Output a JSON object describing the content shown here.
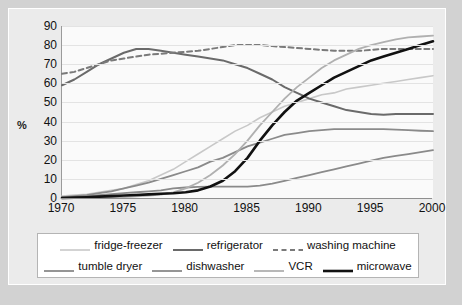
{
  "chart_data": {
    "type": "line",
    "title": "",
    "xlabel": "",
    "ylabel": "%",
    "xlim": [
      1970,
      2000
    ],
    "ylim": [
      0,
      90
    ],
    "grid": true,
    "legend_position": "bottom",
    "x_ticks": [
      "1970",
      "1975",
      "1980",
      "1985",
      "1990",
      "1995",
      "2000"
    ],
    "y_ticks": [
      "0",
      "10",
      "20",
      "30",
      "40",
      "50",
      "60",
      "70",
      "80",
      "90"
    ],
    "x": [
      1970,
      1971,
      1972,
      1973,
      1974,
      1975,
      1976,
      1977,
      1978,
      1979,
      1980,
      1981,
      1982,
      1983,
      1984,
      1985,
      1986,
      1987,
      1988,
      1989,
      1990,
      1991,
      1992,
      1993,
      1994,
      1995,
      1996,
      1997,
      1998,
      1999,
      2000
    ],
    "series": [
      {
        "name": "fridge-freezer",
        "color": "#c8c8c8",
        "width": 1.6,
        "dash": "none",
        "values": [
          1,
          1.5,
          2,
          3,
          4,
          5,
          7,
          9,
          12,
          15,
          19,
          23,
          27,
          31,
          35,
          38,
          42,
          45,
          48,
          50,
          52,
          54,
          55,
          57,
          58,
          59,
          60,
          61,
          62,
          63,
          64
        ]
      },
      {
        "name": "refrigerator",
        "color": "#6a6a6a",
        "width": 2.0,
        "dash": "none",
        "values": [
          59,
          62,
          66,
          70,
          73,
          76,
          78,
          78,
          77,
          76,
          75,
          74,
          73,
          72,
          70,
          68,
          65,
          62,
          58,
          55,
          52,
          50,
          48,
          46,
          45,
          44,
          43.5,
          44,
          44,
          44,
          44
        ]
      },
      {
        "name": "washing machine",
        "color": "#7a7a7a",
        "width": 2.0,
        "dash": "dashed",
        "values": [
          65,
          66,
          68,
          70,
          72,
          73,
          74,
          75,
          75.5,
          76,
          76.5,
          77,
          78,
          79,
          80,
          80,
          80,
          79.5,
          79,
          78.5,
          78,
          77.5,
          77,
          77,
          77,
          77.5,
          78,
          78,
          78,
          78,
          78
        ]
      },
      {
        "name": "tumble dryer",
        "color": "#8a8a8a",
        "width": 1.8,
        "dash": "none",
        "values": [
          0.5,
          1,
          1.5,
          2.5,
          3.5,
          5,
          6.5,
          8,
          10,
          12,
          14,
          16,
          19,
          21,
          24,
          27,
          29,
          31,
          33,
          34,
          35,
          35.5,
          36,
          36,
          36,
          36,
          36,
          35.8,
          35.5,
          35.2,
          35
        ]
      },
      {
        "name": "dishwasher",
        "color": "#8a8a8a",
        "width": 1.8,
        "dash": "none",
        "values": [
          0.3,
          0.6,
          1,
          1.5,
          2,
          2.5,
          3,
          3.5,
          4,
          5,
          5.5,
          5.8,
          6,
          6,
          6,
          6,
          6.5,
          7.5,
          9,
          10.5,
          12,
          13.5,
          15,
          16.5,
          18,
          19.5,
          21,
          22,
          23,
          24,
          25
        ]
      },
      {
        "name": "VCR",
        "color": "#b0b0b0",
        "width": 1.8,
        "dash": "none",
        "values": [
          0,
          0,
          0,
          0,
          0.3,
          0.5,
          0.8,
          1.2,
          1.8,
          3,
          5,
          8,
          12,
          17,
          23,
          30,
          38,
          45,
          52,
          58,
          63,
          68,
          72,
          75,
          78,
          80,
          81.5,
          83,
          84,
          84.5,
          85
        ]
      },
      {
        "name": "microwave",
        "color": "#111111",
        "width": 2.6,
        "dash": "none",
        "values": [
          0,
          0.2,
          0.4,
          0.7,
          1,
          1.3,
          1.6,
          1.9,
          2.2,
          2.5,
          3,
          4,
          6,
          9,
          14,
          21,
          30,
          38,
          45,
          51,
          55,
          59,
          63,
          66,
          69,
          72,
          74,
          76,
          78,
          80,
          82
        ]
      }
    ]
  },
  "legend": {
    "rows": [
      [
        {
          "label": "fridge-freezer",
          "series": "fridge-freezer"
        },
        {
          "label": "refrigerator",
          "series": "refrigerator"
        },
        {
          "label": "washing machine",
          "series": "washing machine"
        }
      ],
      [
        {
          "label": "tumble dryer",
          "series": "tumble dryer"
        },
        {
          "label": "dishwasher",
          "series": "dishwasher"
        },
        {
          "label": "VCR",
          "series": "VCR"
        },
        {
          "label": "microwave",
          "series": "microwave"
        }
      ]
    ]
  }
}
